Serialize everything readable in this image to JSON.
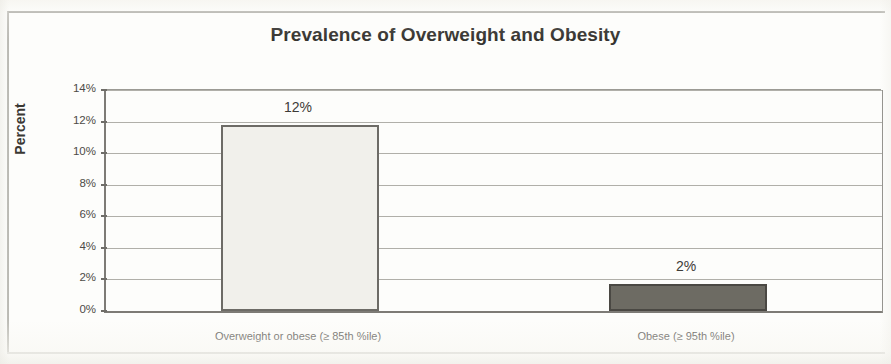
{
  "chart_data": {
    "type": "bar",
    "title": "Prevalence of Overweight and Obesity",
    "xlabel": "",
    "ylabel": "Percent",
    "ylim": [
      0,
      14
    ],
    "ytick_labels": [
      "14%",
      "12%",
      "10%",
      "8%",
      "6%",
      "4%",
      "2%",
      "0%"
    ],
    "ytick_values": [
      14,
      12,
      10,
      8,
      6,
      4,
      2,
      0
    ],
    "grid": true,
    "legend": "none",
    "categories": [
      "Overweight or obese (≥ 85th %ile)",
      "Obese (≥ 95th %ile)"
    ],
    "values": [
      11.8,
      1.7
    ],
    "data_labels": [
      "12%",
      "2%"
    ],
    "bar_colors": [
      "#f1f0eb",
      "#6d6b63"
    ],
    "bar_border_colors": [
      "#6d6b66",
      "#4a4843"
    ]
  },
  "colors": {
    "title_text": "#35332f",
    "axis_text": "#4d4b47",
    "axis_line": "#7d7b76",
    "gridline": "#b0afa9",
    "page_background": "#fdfdfb",
    "frame": "#b9b8b2"
  }
}
